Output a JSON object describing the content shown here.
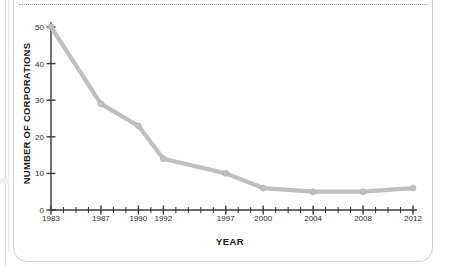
{
  "chart_data": {
    "type": "line",
    "title": "",
    "xlabel": "YEAR",
    "ylabel": "NUMBER OF CORPORATIONS",
    "x": [
      1983,
      1987,
      1990,
      1992,
      1997,
      2000,
      2004,
      2008,
      2012
    ],
    "values": [
      50,
      29,
      23,
      14,
      10,
      6,
      5,
      5,
      6
    ],
    "categories": [
      "1983",
      "1987",
      "1990",
      "1992",
      "1997",
      "2000",
      "2004",
      "2008",
      "2012"
    ],
    "series": [
      {
        "name": "Number of corporations",
        "values": [
          50,
          29,
          23,
          14,
          10,
          6,
          5,
          5,
          6
        ]
      }
    ],
    "ylim": [
      0,
      52
    ],
    "xlim": [
      1983,
      2012
    ],
    "ytick_labels": [
      "0",
      "10",
      "20",
      "30",
      "40",
      "50"
    ],
    "ytick_values": [
      0,
      10,
      20,
      30,
      40,
      50
    ],
    "xtick_labels": [
      "1983",
      "1987",
      "1990",
      "1992",
      "1997",
      "2000",
      "2004",
      "2008",
      "2012"
    ],
    "xtick_values": [
      1983,
      1987,
      1990,
      1992,
      1997,
      2000,
      2004,
      2008,
      2012
    ],
    "minor_xticks": [
      1983,
      1984,
      1985,
      1986,
      1987,
      1988,
      1989,
      1990,
      1991,
      1992,
      1993,
      1994,
      1995,
      1996,
      1997,
      1998,
      1999,
      2000,
      2001,
      2002,
      2003,
      2004,
      2005,
      2006,
      2007,
      2008,
      2009,
      2010,
      2011,
      2012
    ],
    "grid": false,
    "legend": "none",
    "line_color": "#bfbfbf",
    "marker_color": "#bfbfbf",
    "axis_color": "#3a3a3a",
    "text_color": "#1a1a1a"
  },
  "frame": {
    "card_border_color": "#d0d0d0",
    "dotted_rule_color": "#9a9a9a",
    "background": "#ffffff"
  }
}
